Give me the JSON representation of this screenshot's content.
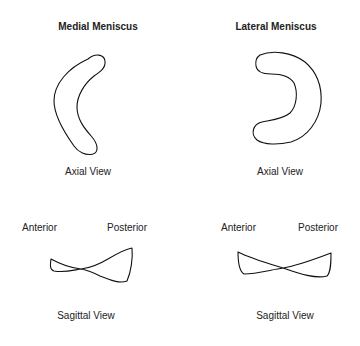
{
  "panels": [
    {
      "title": "Medial Meniscus",
      "axial_label": "Axial View",
      "anterior_label": "Anterior",
      "posterior_label": "Posterior",
      "sagittal_label": "Sagittal View"
    },
    {
      "title": "Lateral Meniscus",
      "axial_label": "Axial View",
      "anterior_label": "Anterior",
      "posterior_label": "Posterior",
      "sagittal_label": "Sagittal View"
    }
  ]
}
